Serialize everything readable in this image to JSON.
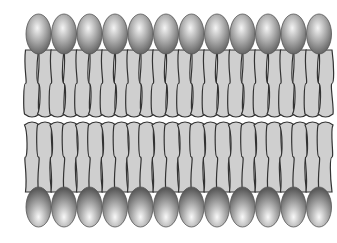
{
  "diagram": {
    "heads_per_leaflet": 12,
    "head_start_x": 26,
    "head_spacing": 25.5,
    "head_rx": 12.5,
    "head_ry": 20,
    "top_head_cy": 34,
    "bottom_head_cy": 207,
    "colors": {
      "head_light": "#f4f4f4",
      "head_mid": "#a8a8a8",
      "head_dark": "#5a5a5a",
      "tail_fill": "#cfcfcf",
      "outline": "#333333"
    },
    "leaflets": [
      {
        "name": "outer-leaflet"
      },
      {
        "name": "inner-leaflet"
      }
    ]
  }
}
